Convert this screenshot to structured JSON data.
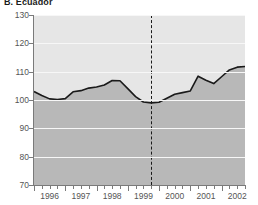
{
  "chart_data": {
    "type": "area",
    "title": "B. Ecuador",
    "xlabel": "",
    "ylabel": "",
    "ylim": [
      70,
      130
    ],
    "yticks": [
      70,
      80,
      90,
      100,
      110,
      120,
      130
    ],
    "ytick_labels": [
      "70",
      "80",
      "90",
      "100",
      "110",
      "120",
      "130"
    ],
    "xlim": [
      1996.0,
      2002.75
    ],
    "xtick_labels": [
      "1996",
      "1997",
      "1998",
      "1999",
      "2000",
      "2001",
      "2002"
    ],
    "xtick_years": [
      1996,
      1997,
      1998,
      1999,
      2000,
      2001,
      2002
    ],
    "minor_ticks_per_year": 4,
    "grid": true,
    "legend": "none",
    "annotations": [
      {
        "type": "vertical-dashed-line",
        "x": 1999.75,
        "label": ""
      }
    ],
    "series": [
      {
        "name": "index",
        "x": [
          1996.0,
          1996.25,
          1996.5,
          1996.75,
          1997.0,
          1997.25,
          1997.5,
          1997.75,
          1998.0,
          1998.25,
          1998.5,
          1998.75,
          1999.0,
          1999.25,
          1999.5,
          1999.75,
          2000.0,
          2000.25,
          2000.5,
          2000.75,
          2001.0,
          2001.25,
          2001.5,
          2001.75,
          2002.0,
          2002.25,
          2002.5,
          2002.75
        ],
        "values": [
          103.0,
          101.6,
          100.4,
          100.2,
          100.5,
          102.9,
          103.3,
          104.2,
          104.6,
          105.3,
          106.9,
          106.8,
          104.0,
          101.2,
          99.3,
          99.0,
          99.2,
          100.6,
          102.0,
          102.6,
          103.2,
          108.4,
          107.0,
          105.8,
          108.2,
          110.6,
          111.6,
          111.8
        ]
      }
    ],
    "colors": {
      "plot_background": "#e6e6e6",
      "fill": "#b8b8b8",
      "line": "#1a1a1a",
      "gridline": "#f7f7f7",
      "axis": "#7a7a7a",
      "text": "#555555",
      "title": "#1a1a1a"
    }
  }
}
